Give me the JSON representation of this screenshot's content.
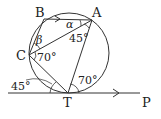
{
  "diagram": {
    "type": "circle-geometry",
    "points": {
      "A": {
        "label": "A"
      },
      "B": {
        "label": "B"
      },
      "C": {
        "label": "C"
      },
      "T": {
        "label": "T"
      },
      "P": {
        "label": "P"
      }
    },
    "angles": {
      "alpha": "α",
      "beta": "β",
      "at_A": "45°",
      "at_C": "70°",
      "at_T_right": "70°",
      "at_T_left": "45°"
    },
    "colors": {
      "stroke": "#333333",
      "background": "#ffffff"
    }
  }
}
